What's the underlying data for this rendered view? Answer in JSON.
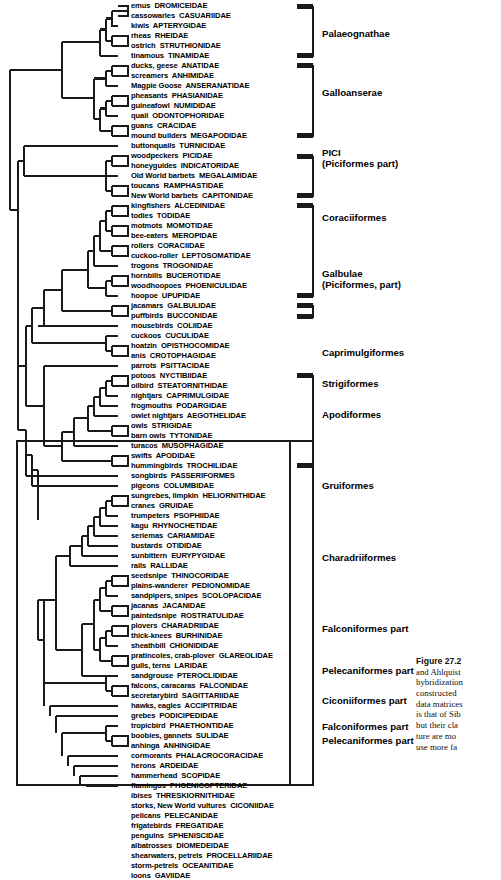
{
  "figure": {
    "number": "Figure 27.2",
    "caption_lines": [
      "and Ahlquist",
      "hybridization",
      "constructed",
      "data matrices",
      "is that of Sib",
      "but their cla",
      "ture are mo",
      "use more fa"
    ]
  },
  "tree": {
    "tips": [
      {
        "common": "emus",
        "family": "DROMICEIDAE"
      },
      {
        "common": "cassowaries",
        "family": "CASUARIIDAE"
      },
      {
        "common": "kiwis",
        "family": "APTERYGIDAE"
      },
      {
        "common": "rheas",
        "family": "RHEIDAE"
      },
      {
        "common": "ostrich",
        "family": "STRUTHIONIDAE"
      },
      {
        "common": "tinamous",
        "family": "TINAMIDAE"
      },
      {
        "common": "ducks, geese",
        "family": "ANATIDAE"
      },
      {
        "common": "screamers",
        "family": "ANHIMIDAE"
      },
      {
        "common": "Magpie Goose",
        "family": "ANSERANATIDAE"
      },
      {
        "common": "pheasants",
        "family": "PHASIANIDAE"
      },
      {
        "common": "guineafowl",
        "family": "NUMIDIDAE"
      },
      {
        "common": "quail",
        "family": "ODONTOPHORIDAE"
      },
      {
        "common": "guans",
        "family": "CRACIDAE"
      },
      {
        "common": "mound builders",
        "family": "MEGAPODIDAE"
      },
      {
        "common": "buttonquails",
        "family": "TURNICIDAE"
      },
      {
        "common": "woodpeckers",
        "family": "PICIDAE"
      },
      {
        "common": "honeyguides",
        "family": "INDICATORIDAE"
      },
      {
        "common": "Old World barbets",
        "family": "MEGALAIMIDAE"
      },
      {
        "common": "toucans",
        "family": "RAMPHASTIDAE"
      },
      {
        "common": "New World barbets",
        "family": "CAPITONIDAE"
      },
      {
        "common": "kingfishers",
        "family": "ALCEDINIDAE"
      },
      {
        "common": "todies",
        "family": "TODIDAE"
      },
      {
        "common": "motmots",
        "family": "MOMOTIDAE"
      },
      {
        "common": "bee-eaters",
        "family": "MEROPIDAE"
      },
      {
        "common": "rollers",
        "family": "CORACIIDAE"
      },
      {
        "common": "cuckoo-roller",
        "family": "LEPTOSOMATIDAE"
      },
      {
        "common": "trogons",
        "family": "TROGONIDAE"
      },
      {
        "common": "hornbills",
        "family": "BUCEROTIDAE"
      },
      {
        "common": "woodhoopoes",
        "family": "PHOENICULIDAE"
      },
      {
        "common": "hoopoe",
        "family": "UPUPIDAE"
      },
      {
        "common": "jacamars",
        "family": "GALBULIDAE"
      },
      {
        "common": "puffbirds",
        "family": "BUCCONIDAE"
      },
      {
        "common": "mousebirds",
        "family": "COLIIDAE"
      },
      {
        "common": "cuckoos",
        "family": "CUCULIDAE"
      },
      {
        "common": "hoatzin",
        "family": "OPISTHOCOMIDAE"
      },
      {
        "common": "anis",
        "family": "CROTOPHAGIDAE"
      },
      {
        "common": "parrots",
        "family": "PSITTACIDAE"
      },
      {
        "common": "potoos",
        "family": "NYCTIBIIDAE"
      },
      {
        "common": "oilbird",
        "family": "STEATORNITHIDAE"
      },
      {
        "common": "nightjars",
        "family": "CAPRIMULGIDAE"
      },
      {
        "common": "frogmouths",
        "family": "PODARGIDAE"
      },
      {
        "common": "owlet nightjars",
        "family": "AEGOTHELIDAE"
      },
      {
        "common": "owls",
        "family": "STRIGIDAE"
      },
      {
        "common": "barn owls",
        "family": "TYTONIDAE"
      },
      {
        "common": "turacos",
        "family": "MUSOPHAGIDAE"
      },
      {
        "common": "swifts",
        "family": "APODIDAE"
      },
      {
        "common": "hummingbirds",
        "family": "TROCHILIDAE"
      },
      {
        "common": "songbirds",
        "family": "PASSERIFORMES"
      },
      {
        "common": "pigeons",
        "family": "COLUMBIDAE"
      },
      {
        "common": "sungrebes, limpkin",
        "family": "HELIORNITHIDAE"
      },
      {
        "common": "cranes",
        "family": "GRUIDAE"
      },
      {
        "common": "trumpeters",
        "family": "PSOPHIIDAE"
      },
      {
        "common": "kagu",
        "family": "RHYNOCHETIDAE"
      },
      {
        "common": "seriemas",
        "family": "CARIAMIDAE"
      },
      {
        "common": "bustards",
        "family": "OTIDIDAE"
      },
      {
        "common": "sunbittern",
        "family": "EURYPYGIDAE"
      },
      {
        "common": "rails",
        "family": "RALLIDAE"
      },
      {
        "common": "seedsnipe",
        "family": "THINOCORIDAE"
      },
      {
        "common": "plains-wanderer",
        "family": "PEDIONOMIDAE"
      },
      {
        "common": "sandpipers, snipes",
        "family": "SCOLOPACIDAE"
      },
      {
        "common": "jacanas",
        "family": "JACANIDAE"
      },
      {
        "common": "paintedsnipe",
        "family": "ROSTRATULIDAE"
      },
      {
        "common": "plovers",
        "family": "CHARADRIIDAE"
      },
      {
        "common": "thick-knees",
        "family": "BURHINIDAE"
      },
      {
        "common": "sheathbill",
        "family": "CHIONIDIDAE"
      },
      {
        "common": "pratincoles, crab-plover",
        "family": "GLAREOLIDAE"
      },
      {
        "common": "gulls, terns",
        "family": "LARIDAE"
      },
      {
        "common": "sandgrouse",
        "family": "PTEROCLIDIDAE"
      },
      {
        "common": "falcons, caracaras",
        "family": "FALCONIDAE"
      },
      {
        "common": "secretarybird",
        "family": "SAGITTARIIDAE"
      },
      {
        "common": "hawks, eagles",
        "family": "ACCIPITRIDAE"
      },
      {
        "common": "grebes",
        "family": "PODICIPEDIDAE"
      },
      {
        "common": "tropicbird",
        "family": "PHAETHONTIDAE"
      },
      {
        "common": "boobies, gannets",
        "family": "SULIDAE"
      },
      {
        "common": "anhinga",
        "family": "ANHINGIDAE"
      },
      {
        "common": "cormorants",
        "family": "PHALACROCORACIDAE"
      },
      {
        "common": "herons",
        "family": "ARDEIDAE"
      },
      {
        "common": "hammerhead",
        "family": "SCOPIDAE"
      },
      {
        "common": "flamingos",
        "family": "PHOENICOPTERIDAE"
      },
      {
        "common": "ibises",
        "family": "THRESKIORNITHIDAE"
      },
      {
        "common": "storks, New World vultures",
        "family": "CICONIIDAE"
      },
      {
        "common": "pelicans",
        "family": "PELECANIDAE"
      },
      {
        "common": "frigatebirds",
        "family": "FREGATIDAE"
      },
      {
        "common": "penguins",
        "family": "SPHENISCIDAE"
      },
      {
        "common": "albatrosses",
        "family": "DIOMEDEIDAE"
      },
      {
        "common": "shearwaters, petrels",
        "family": "PROCELLARIIDAE"
      },
      {
        "common": "storm-petrels",
        "family": "OCEANITIDAE"
      },
      {
        "common": "loons",
        "family": "GAVIIDAE"
      }
    ],
    "clade_labels": [
      {
        "name": "Palaeognathae",
        "lines": [
          "Palaeognathae"
        ],
        "y": 28
      },
      {
        "name": "Galloanserae",
        "lines": [
          "Galloanserae"
        ],
        "y": 87
      },
      {
        "name": "PICI",
        "lines": [
          "PICI",
          "(Piciformes part)"
        ],
        "y": 147
      },
      {
        "name": "Coraciiformes",
        "lines": [
          "Coraciiformes"
        ],
        "y": 212
      },
      {
        "name": "Galbulae",
        "lines": [
          "Galbulae",
          "(Piciformes, part)"
        ],
        "y": 268
      },
      {
        "name": "Caprimulgiformes",
        "lines": [
          "Caprimulgiformes"
        ],
        "y": 347
      },
      {
        "name": "Strigiformes",
        "lines": [
          "Strigiformes"
        ],
        "y": 378
      },
      {
        "name": "Apodiformes",
        "lines": [
          "Apodiformes"
        ],
        "y": 409
      },
      {
        "name": "Gruiformes",
        "lines": [
          "Gruiformes"
        ],
        "y": 480
      },
      {
        "name": "Charadriiformes",
        "lines": [
          "Charadriiformes"
        ],
        "y": 552
      },
      {
        "name": "Falconiformes part",
        "lines": [
          "Falconiformes part"
        ],
        "y": 623
      },
      {
        "name": "Pelecaniformes part",
        "lines": [
          "Pelecaniformes part"
        ],
        "y": 665
      },
      {
        "name": "Ciconiiformes part",
        "lines": [
          "Ciconiiformes part"
        ],
        "y": 695
      },
      {
        "name": "Falconiformes part",
        "lines": [
          "Falconiformes part"
        ],
        "y": 721
      },
      {
        "name": "Pelecaniformes part",
        "lines": [
          "Pelecaniformes part"
        ],
        "y": 735
      }
    ]
  }
}
